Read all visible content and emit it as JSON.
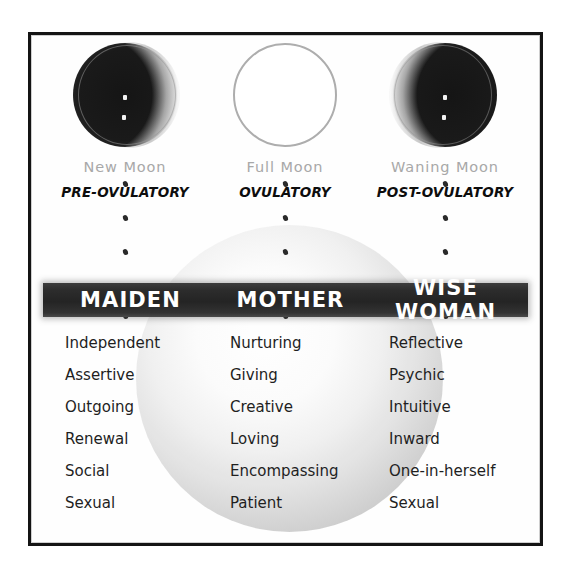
{
  "poster": {
    "background_color": "#ffffff",
    "frame_color": "#141414",
    "sphere_color": "#d2d2d2"
  },
  "moons": [
    {
      "icon": "new-moon-icon",
      "phase_label": "New Moon",
      "cycle_label": "PRE-OVULATORY"
    },
    {
      "icon": "full-moon-icon",
      "phase_label": "Full Moon",
      "cycle_label": "OVULATORY"
    },
    {
      "icon": "waning-moon-icon",
      "phase_label": "Waning Moon",
      "cycle_label": "POST-OVULATORY"
    }
  ],
  "banner": {
    "background_color": "#2c2c2c",
    "text_color": "#ffffff",
    "archetypes": [
      {
        "label": "MAIDEN"
      },
      {
        "label": "MOTHER"
      },
      {
        "label": "WISE WOMAN"
      }
    ]
  },
  "columns": [
    {
      "archetype": "MAIDEN",
      "words": [
        "Independent",
        "Assertive",
        "Outgoing",
        "Renewal",
        "Social",
        "Sexual"
      ]
    },
    {
      "archetype": "MOTHER",
      "words": [
        "Nurturing",
        "Giving",
        "Creative",
        "Loving",
        "Encompassing",
        "Patient"
      ]
    },
    {
      "archetype": "WISE WOMAN",
      "words": [
        "Reflective",
        "Psychic",
        "Intuitive",
        "Inward",
        "One-in-herself",
        "Sexual"
      ]
    }
  ]
}
